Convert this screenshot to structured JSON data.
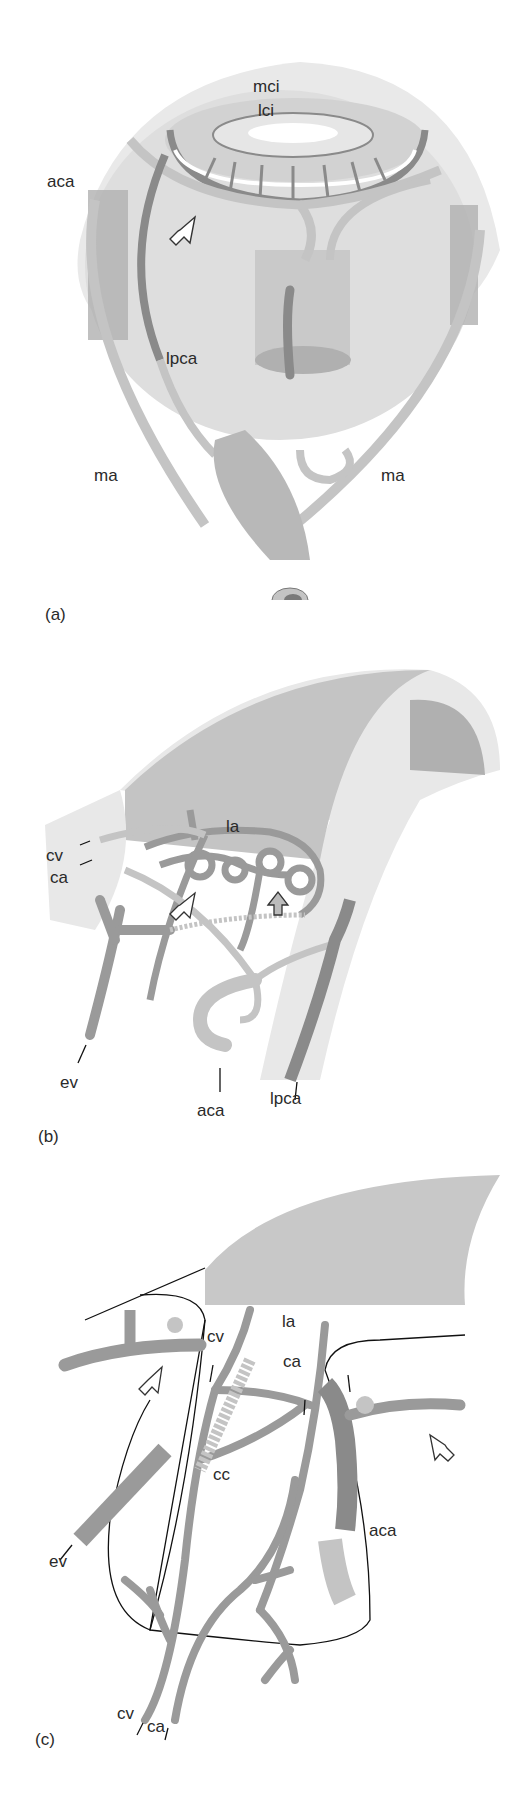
{
  "figure": {
    "colors": {
      "background": "#ffffff",
      "globe_light": "#e6e6e6",
      "globe_mid": "#d4d4d4",
      "vessel_light": "#c4c4c4",
      "vessel_mid": "#a8a8a8",
      "vessel_dark": "#8a8a8a",
      "outline": "#111111"
    },
    "panels": [
      {
        "id": "a",
        "caption": "(a)",
        "labels": {
          "mci": "mci",
          "lci": "lci",
          "aca": "aca",
          "lpca": "lpca",
          "ma_left": "ma",
          "ma_right": "ma"
        }
      },
      {
        "id": "b",
        "caption": "(b)",
        "labels": {
          "la": "la",
          "cv": "cv",
          "ca": "ca",
          "ev": "ev",
          "aca": "aca",
          "lpca": "lpca"
        }
      },
      {
        "id": "c",
        "caption": "(c)",
        "labels": {
          "cv_top": "cv",
          "la": "la",
          "ca_top": "ca",
          "cc": "cc",
          "ev": "ev",
          "aca": "aca",
          "cv_bottom": "cv",
          "ca_bottom": "ca"
        }
      }
    ]
  }
}
